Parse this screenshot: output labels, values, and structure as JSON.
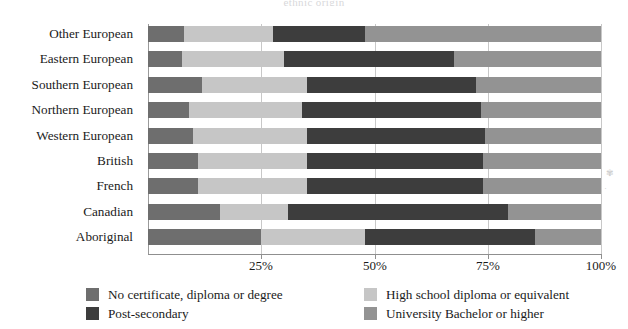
{
  "chart_data": {
    "type": "bar",
    "orientation": "horizontal",
    "stacked": true,
    "normalized_percent": true,
    "title": "ethnic origin",
    "xlabel": "",
    "ylabel": "",
    "xlim": [
      0,
      100
    ],
    "xticks": [
      25,
      50,
      75,
      100
    ],
    "xtick_labels": [
      "25%",
      "50%",
      "75%",
      "100%"
    ],
    "grid": true,
    "legend_position": "bottom",
    "categories": [
      "Other European",
      "Eastern European",
      "Southern European",
      "Northern European",
      "Western European",
      "British",
      "French",
      "Canadian",
      "Aboriginal"
    ],
    "series": [
      {
        "name": "No certificate, diploma or degree",
        "color": "#6e6e6e",
        "values": [
          8.0,
          7.5,
          12.0,
          9.0,
          10.0,
          11.0,
          11.0,
          16.0,
          25.0
        ]
      },
      {
        "name": "High school diploma or equivalent",
        "color": "#c6c6c6",
        "values": [
          19.5,
          22.5,
          23.0,
          25.0,
          25.0,
          24.0,
          24.0,
          15.0,
          23.0
        ]
      },
      {
        "name": "Post-secondary",
        "color": "#3d3d3d",
        "values": [
          20.5,
          37.5,
          37.5,
          39.5,
          39.5,
          39.0,
          39.0,
          48.5,
          37.5
        ]
      },
      {
        "name": "University Bachelor or higher",
        "color": "#939393",
        "values": [
          52.0,
          32.5,
          27.5,
          26.5,
          25.5,
          26.0,
          26.0,
          20.5,
          14.5
        ]
      }
    ]
  },
  "axis": {
    "ticks": [
      {
        "label": "25%",
        "value": 25
      },
      {
        "label": "50%",
        "value": 50
      },
      {
        "label": "75%",
        "value": 75
      },
      {
        "label": "100%",
        "value": 100
      }
    ]
  },
  "legend": {
    "items": [
      {
        "label": "No certificate, diploma or degree",
        "color": "#6e6e6e"
      },
      {
        "label": "High school diploma or equivalent",
        "color": "#c6c6c6"
      },
      {
        "label": "Post-secondary",
        "color": "#3d3d3d"
      },
      {
        "label": "University Bachelor or higher",
        "color": "#939393"
      }
    ]
  }
}
